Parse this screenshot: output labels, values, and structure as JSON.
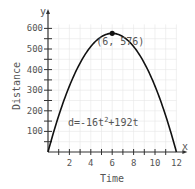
{
  "chart_data": {
    "type": "line",
    "title": "",
    "xlabel": "Time",
    "ylabel": "Distance",
    "x_axis_letter": "x",
    "y_axis_letter": "y",
    "xlim": [
      0,
      12
    ],
    "ylim": [
      0,
      600
    ],
    "x_ticks": [
      2,
      4,
      6,
      8,
      10,
      12
    ],
    "y_ticks": [
      100,
      200,
      300,
      400,
      500,
      600
    ],
    "grid": true,
    "equation": "d=-16t²+192t",
    "vertex": {
      "x": 6,
      "y": 576,
      "label": "(6, 576)"
    },
    "series": [
      {
        "name": "d=-16t²+192t",
        "x": [
          0,
          1,
          2,
          3,
          4,
          5,
          6,
          7,
          8,
          9,
          10,
          11,
          12
        ],
        "values": [
          0,
          176,
          320,
          432,
          512,
          560,
          576,
          560,
          512,
          432,
          320,
          176,
          0
        ]
      }
    ]
  },
  "labels": {
    "xlabel": "Time",
    "ylabel": "Distance",
    "x_letter": "x",
    "y_letter": "y",
    "equation_prefix": "d=-16t",
    "equation_exp": "2",
    "equation_suffix": "+192t",
    "vertex_label": "(6, 576)",
    "x_ticks": [
      "2",
      "4",
      "6",
      "8",
      "10",
      "12"
    ],
    "y_ticks": [
      "100",
      "200",
      "300",
      "400",
      "500",
      "600"
    ]
  }
}
